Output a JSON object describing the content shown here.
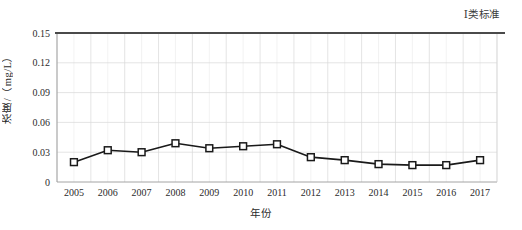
{
  "chart_data": {
    "type": "line",
    "title": "",
    "xlabel": "年份",
    "ylabel": "浓度/（mg/L）",
    "categories": [
      "2005",
      "2006",
      "2007",
      "2008",
      "2009",
      "2010",
      "2011",
      "2012",
      "2013",
      "2014",
      "2015",
      "2016",
      "2017"
    ],
    "x": [
      2005,
      2006,
      2007,
      2008,
      2009,
      2010,
      2011,
      2012,
      2013,
      2014,
      2015,
      2016,
      2017
    ],
    "values": [
      0.02,
      0.032,
      0.03,
      0.039,
      0.034,
      0.036,
      0.038,
      0.025,
      0.022,
      0.018,
      0.017,
      0.017,
      0.022
    ],
    "series": [
      {
        "name": "浓度",
        "values": [
          0.02,
          0.032,
          0.03,
          0.039,
          0.034,
          0.036,
          0.038,
          0.025,
          0.022,
          0.018,
          0.017,
          0.017,
          0.022
        ],
        "marker": "open-square",
        "color": "#1a1a1a"
      }
    ],
    "ylim": [
      0,
      0.15
    ],
    "yticks": [
      0,
      0.03,
      0.06,
      0.09,
      0.12,
      0.15
    ],
    "ytick_labels": [
      "0",
      "0.03",
      "0.06",
      "0.09",
      "0.12",
      "0.15"
    ],
    "xtick_labels": [
      "2005",
      "2006",
      "2007",
      "2008",
      "2009",
      "2010",
      "2011",
      "2012",
      "2013",
      "2014",
      "2015",
      "2016",
      "2017"
    ],
    "grid": true,
    "grid_color": "#d9d9d9",
    "legend_position": "top-right",
    "annotations": [
      {
        "name": "class-i-standard",
        "label": "Ⅰ类标准",
        "type": "horizontal-threshold-line",
        "value": 0.15,
        "color": "#4a4a4a"
      }
    ]
  },
  "annotation": {
    "standard_label": "Ⅰ类标准"
  },
  "axes": {
    "y_title": "浓度/（mg/L）",
    "x_title": "年份"
  }
}
